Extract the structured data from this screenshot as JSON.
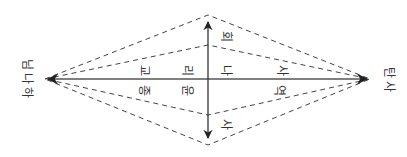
{
  "diagram": {
    "endpoints": {
      "left": "하나님",
      "right": "사탄"
    },
    "labels": {
      "religion": "종교",
      "ethics": "윤리",
      "self": "나",
      "history": "역사",
      "society": "사회"
    },
    "chars": {
      "jong": "종",
      "gyo": "교",
      "yun": "윤",
      "ri": "리",
      "na": "나",
      "yeok": "역",
      "sa1": "사",
      "sa2": "사",
      "hoe": "회",
      "ha": "하",
      "na2": "나",
      "nim": "님",
      "sa3": "사",
      "tan": "탄"
    },
    "colors": {
      "line": "#444444",
      "dash": "#444444",
      "text": "#333333"
    }
  }
}
